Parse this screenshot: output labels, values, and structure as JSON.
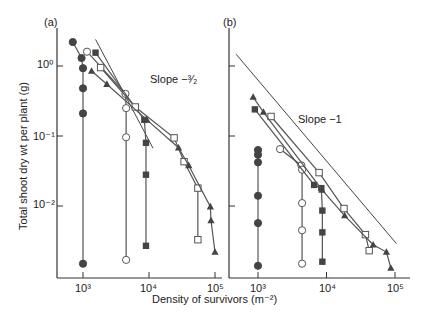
{
  "figure": {
    "ylabel": "Total shoot dry wt per plant (g)",
    "xlabel": "Density of survivors (m⁻²)",
    "panels": [
      {
        "id": "a",
        "label": "(a)",
        "annotation": "Slope −³⁄₂"
      },
      {
        "id": "b",
        "label": "(b)",
        "annotation": "Slope −1"
      }
    ],
    "y_ticks": [
      "10⁰",
      "10⁻¹",
      "10⁻²"
    ],
    "x_ticks": [
      "10³",
      "10⁴",
      "10⁵"
    ]
  },
  "chart_data": [
    {
      "type": "line",
      "title": "(a)",
      "xlabel": "Density of survivors (m^-2)",
      "ylabel": "Total shoot dry wt per plant (g)",
      "xscale": "log",
      "yscale": "log",
      "xlim": [
        550,
        130000
      ],
      "ylim": [
        0.0016,
        3.0
      ],
      "grid": false,
      "annotations": [
        {
          "text": "Slope -3/2",
          "type": "reference_line",
          "x": [
            1550,
            11500
          ],
          "y": [
            2.4,
            0.067
          ]
        }
      ],
      "series": [
        {
          "name": "filled circle",
          "marker": "filled-circle",
          "x": [
            700,
            950,
            1000,
            1000,
            1000,
            1000
          ],
          "y": [
            2.2,
            1.3,
            0.93,
            0.48,
            0.21,
            0.0015
          ]
        },
        {
          "name": "open circle",
          "marker": "open-circle",
          "x": [
            1150,
            4400,
            4500,
            4500,
            4500
          ],
          "y": [
            1.6,
            0.4,
            0.25,
            0.096,
            0.0017
          ]
        },
        {
          "name": "filled square",
          "marker": "filled-square",
          "x": [
            1550,
            8500,
            9000,
            9000,
            9000
          ],
          "y": [
            1.55,
            0.17,
            0.08,
            0.028,
            0.0027
          ]
        },
        {
          "name": "open square",
          "marker": "open-square",
          "x": [
            1850,
            6200,
            24000,
            34000,
            55000,
            55000
          ],
          "y": [
            0.95,
            0.26,
            0.094,
            0.043,
            0.018,
            0.0033
          ]
        },
        {
          "name": "filled triangle",
          "marker": "filled-triangle",
          "x": [
            1350,
            2300,
            9300,
            28000,
            40000,
            85000,
            87000,
            100000
          ],
          "y": [
            0.85,
            0.55,
            0.17,
            0.068,
            0.038,
            0.0098,
            0.0062,
            0.0022
          ]
        }
      ]
    },
    {
      "type": "line",
      "title": "(b)",
      "xlabel": "Density of survivors (m^-2)",
      "ylabel": "Total shoot dry wt per plant (g)",
      "xscale": "log",
      "yscale": "log",
      "xlim": [
        380,
        130000
      ],
      "ylim": [
        0.0016,
        3.0
      ],
      "grid": false,
      "annotations": [
        {
          "text": "Slope -1",
          "type": "reference_line",
          "x": [
            480,
            105000
          ],
          "y": [
            1.47,
            0.0029
          ]
        }
      ],
      "series": [
        {
          "name": "filled circle",
          "marker": "filled-circle",
          "x": [
            1000,
            1000,
            1000,
            1000,
            1000,
            1000
          ],
          "y": [
            0.063,
            0.054,
            0.042,
            0.014,
            0.0057,
            0.0014
          ]
        },
        {
          "name": "open circle",
          "marker": "open-circle",
          "x": [
            2100,
            4300,
            4400,
            4400,
            4400,
            4400
          ],
          "y": [
            0.065,
            0.038,
            0.033,
            0.011,
            0.0045,
            0.0015
          ]
        },
        {
          "name": "filled square",
          "marker": "filled-square",
          "x": [
            900,
            6600,
            8400,
            8700,
            8700,
            8700
          ],
          "y": [
            0.24,
            0.02,
            0.018,
            0.0086,
            0.0042,
            0.0016
          ]
        },
        {
          "name": "open square",
          "marker": "open-square",
          "x": [
            1550,
            7800,
            18000,
            37000,
            42000
          ],
          "y": [
            0.19,
            0.03,
            0.0092,
            0.0039,
            0.0023
          ]
        },
        {
          "name": "filled triangle",
          "marker": "filled-triangle",
          "x": [
            850,
            1200,
            8600,
            18400,
            48000,
            75000,
            87000
          ],
          "y": [
            0.36,
            0.22,
            0.017,
            0.0073,
            0.0028,
            0.0022,
            0.0013
          ]
        }
      ]
    }
  ]
}
